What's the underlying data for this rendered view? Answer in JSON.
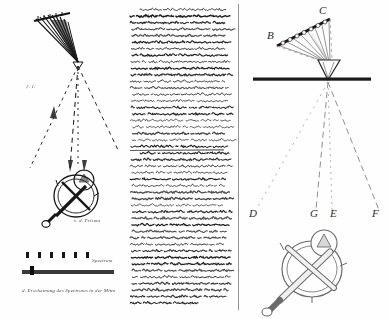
{
  "document": {
    "kind": "handwritten-manuscript-page",
    "script": "German Kurrent cursive",
    "ink_color": "#1a1a1a",
    "paper_color": "#fefefe",
    "rule_color": "#6e6e6e"
  },
  "left_panel": {
    "name": "ink-sketch-panel",
    "figures": [
      {
        "id": "converging-ray-fan",
        "description": "fan of ink rays converging to a point on a horizontal baseline",
        "ray_count": 9,
        "baseline_y": 62
      },
      {
        "id": "divergent-dashed-rays",
        "description": "three dashed rays diverging downward from the convergence point",
        "ray_count": 3
      },
      {
        "id": "prism-instrument-sketch",
        "description": "circular handheld instrument with crossed arms, handle and prism mount"
      },
      {
        "id": "spectrum-strip",
        "description": "horizontal spectrum band with a row of annotation tick marks above"
      }
    ],
    "annotations": [
      {
        "id": "note-near-rays",
        "text": "ƒ. 1."
      },
      {
        "id": "note-near-instrument",
        "text": "v. d. Prisma"
      },
      {
        "id": "caption-spectrum",
        "text": "Spectrum"
      },
      {
        "id": "caption-bottom",
        "text": "d. Erscheinung des Spectrums in der Mitte"
      }
    ]
  },
  "text_panel": {
    "name": "manuscript-text-column",
    "description": "dense column of German Kurrent handwriting",
    "line_count": 46,
    "paragraph_break_after_line": 22,
    "right_rule": true
  },
  "right_panel": {
    "name": "optical-diagram-panel",
    "figure": {
      "id": "prism-refraction-diagram",
      "description": "angled aperture bar B-C sending rays through a triangular prism onto a horizontal screen, with refracted rays terminating at D, G, E, F"
    },
    "labels": [
      {
        "id": "label-B",
        "text": "B",
        "x": 270,
        "y": 36
      },
      {
        "id": "label-C",
        "text": "C",
        "x": 320,
        "y": 11
      },
      {
        "id": "label-D",
        "text": "D",
        "x": 251,
        "y": 214
      },
      {
        "id": "label-G",
        "text": "G",
        "x": 312,
        "y": 214
      },
      {
        "id": "label-E",
        "text": "E",
        "x": 332,
        "y": 214
      },
      {
        "id": "label-F",
        "text": "F",
        "x": 374,
        "y": 214
      }
    ],
    "elements": {
      "aperture_bar": {
        "from_x": 277,
        "from_y": 46,
        "to_x": 330,
        "to_y": 19,
        "aperture_count": 8
      },
      "screen_bar": {
        "from_x": 253,
        "from_y": 79,
        "to_x": 371,
        "to_y": 79
      },
      "prism": {
        "apex_x": 328,
        "apex_y": 79,
        "width": 22,
        "height": 20
      },
      "ray_termini": [
        "D",
        "G",
        "E",
        "F"
      ]
    },
    "instrument": {
      "id": "prism-instrument-drawing",
      "description": "circular frame with crossed bars, side handle and a small circular prism holder on top",
      "center_x": 312,
      "center_y": 268
    }
  }
}
